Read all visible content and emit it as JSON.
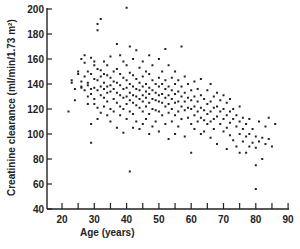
{
  "chart_data": {
    "type": "scatter",
    "title": "",
    "xlabel": "Age  (years)",
    "ylabel": "Creatinine clearance  (ml/min/1.73 m²)",
    "xlim": [
      15,
      90
    ],
    "ylim": [
      40,
      200
    ],
    "x_ticks": [
      20,
      30,
      40,
      50,
      60,
      70,
      80,
      90
    ],
    "x_minor_ticks": [
      25,
      35,
      45,
      55,
      65,
      75,
      85
    ],
    "y_ticks": [
      40,
      60,
      80,
      100,
      120,
      140,
      160,
      180,
      200
    ],
    "y_tick_labels": [
      "40",
      "60",
      "80",
      "100",
      "120",
      "140",
      "160",
      "180",
      "200"
    ],
    "grid": false,
    "legend": null,
    "trend": "negative correlation: clearance declines from ~140 at age 25 to ~95 at age 80",
    "series": [
      {
        "name": "subjects",
        "points": [
          [
            22,
            118
          ],
          [
            23,
            143
          ],
          [
            23,
            141
          ],
          [
            24,
            136
          ],
          [
            24,
            127
          ],
          [
            25,
            148
          ],
          [
            25,
            150
          ],
          [
            26,
            138
          ],
          [
            26,
            137
          ],
          [
            26,
            142
          ],
          [
            26,
            160
          ],
          [
            27,
            163
          ],
          [
            27,
            157
          ],
          [
            27,
            135
          ],
          [
            27,
            146
          ],
          [
            28,
            150
          ],
          [
            28,
            141
          ],
          [
            28,
            139
          ],
          [
            28,
            130
          ],
          [
            28,
            124
          ],
          [
            29,
            161
          ],
          [
            29,
            148
          ],
          [
            29,
            136
          ],
          [
            29,
            132
          ],
          [
            29,
            108
          ],
          [
            29,
            93
          ],
          [
            30,
            158
          ],
          [
            30,
            155
          ],
          [
            30,
            144
          ],
          [
            30,
            137
          ],
          [
            30,
            128
          ],
          [
            30,
            124
          ],
          [
            31,
            188
          ],
          [
            31,
            183
          ],
          [
            31,
            152
          ],
          [
            31,
            143
          ],
          [
            31,
            135
          ],
          [
            31,
            121
          ],
          [
            31,
            112
          ],
          [
            32,
            192
          ],
          [
            32,
            151
          ],
          [
            32,
            146
          ],
          [
            32,
            138
          ],
          [
            32,
            131
          ],
          [
            32,
            117
          ],
          [
            33,
            158
          ],
          [
            33,
            148
          ],
          [
            33,
            141
          ],
          [
            33,
            136
          ],
          [
            33,
            129
          ],
          [
            33,
            122
          ],
          [
            34,
            155
          ],
          [
            34,
            147
          ],
          [
            34,
            138
          ],
          [
            34,
            133
          ],
          [
            34,
            126
          ],
          [
            34,
            115
          ],
          [
            35,
            162
          ],
          [
            35,
            145
          ],
          [
            35,
            139
          ],
          [
            35,
            134
          ],
          [
            35,
            120
          ],
          [
            35,
            110
          ],
          [
            36,
            150
          ],
          [
            36,
            142
          ],
          [
            36,
            136
          ],
          [
            36,
            128
          ],
          [
            36,
            118
          ],
          [
            37,
            172
          ],
          [
            37,
            152
          ],
          [
            37,
            141
          ],
          [
            37,
            133
          ],
          [
            37,
            125
          ],
          [
            37,
            105
          ],
          [
            38,
            163
          ],
          [
            38,
            148
          ],
          [
            38,
            139
          ],
          [
            38,
            131
          ],
          [
            38,
            122
          ],
          [
            38,
            115
          ],
          [
            39,
            158
          ],
          [
            39,
            145
          ],
          [
            39,
            136
          ],
          [
            39,
            129
          ],
          [
            39,
            120
          ],
          [
            39,
            101
          ],
          [
            40,
            201
          ],
          [
            40,
            155
          ],
          [
            40,
            143
          ],
          [
            40,
            137
          ],
          [
            40,
            130
          ],
          [
            40,
            124
          ],
          [
            40,
            112
          ],
          [
            41,
            170
          ],
          [
            41,
            149
          ],
          [
            41,
            140
          ],
          [
            41,
            133
          ],
          [
            41,
            127
          ],
          [
            41,
            118
          ],
          [
            41,
            70
          ],
          [
            42,
            160
          ],
          [
            42,
            147
          ],
          [
            42,
            138
          ],
          [
            42,
            131
          ],
          [
            42,
            125
          ],
          [
            42,
            116
          ],
          [
            42,
            105
          ],
          [
            43,
            167
          ],
          [
            43,
            144
          ],
          [
            43,
            136
          ],
          [
            43,
            130
          ],
          [
            43,
            123
          ],
          [
            43,
            110
          ],
          [
            44,
            153
          ],
          [
            44,
            141
          ],
          [
            44,
            135
          ],
          [
            44,
            128
          ],
          [
            44,
            121
          ],
          [
            44,
            104
          ],
          [
            45,
            158
          ],
          [
            45,
            146
          ],
          [
            45,
            138
          ],
          [
            45,
            131
          ],
          [
            45,
            126
          ],
          [
            45,
            118
          ],
          [
            45,
            108
          ],
          [
            46,
            150
          ],
          [
            46,
            140
          ],
          [
            46,
            134
          ],
          [
            46,
            129
          ],
          [
            46,
            122
          ],
          [
            46,
            112
          ],
          [
            47,
            163
          ],
          [
            47,
            148
          ],
          [
            47,
            137
          ],
          [
            47,
            132
          ],
          [
            47,
            125
          ],
          [
            47,
            116
          ],
          [
            47,
            100
          ],
          [
            48,
            155
          ],
          [
            48,
            143
          ],
          [
            48,
            135
          ],
          [
            48,
            128
          ],
          [
            48,
            120
          ],
          [
            48,
            106
          ],
          [
            49,
            140
          ],
          [
            49,
            133
          ],
          [
            49,
            127
          ],
          [
            49,
            119
          ],
          [
            49,
            110
          ],
          [
            50,
            160
          ],
          [
            50,
            145
          ],
          [
            50,
            138
          ],
          [
            50,
            131
          ],
          [
            50,
            126
          ],
          [
            50,
            118
          ],
          [
            50,
            102
          ],
          [
            51,
            150
          ],
          [
            51,
            140
          ],
          [
            51,
            132
          ],
          [
            51,
            125
          ],
          [
            51,
            115
          ],
          [
            52,
            168
          ],
          [
            52,
            143
          ],
          [
            52,
            136
          ],
          [
            52,
            129
          ],
          [
            52,
            122
          ],
          [
            52,
            108
          ],
          [
            53,
            155
          ],
          [
            53,
            138
          ],
          [
            53,
            131
          ],
          [
            53,
            124
          ],
          [
            53,
            117
          ],
          [
            53,
            96
          ],
          [
            54,
            145
          ],
          [
            54,
            135
          ],
          [
            54,
            128
          ],
          [
            54,
            120
          ],
          [
            54,
            110
          ],
          [
            55,
            150
          ],
          [
            55,
            140
          ],
          [
            55,
            132
          ],
          [
            55,
            125
          ],
          [
            55,
            115
          ],
          [
            55,
            100
          ],
          [
            56,
            143
          ],
          [
            56,
            134
          ],
          [
            56,
            126
          ],
          [
            56,
            118
          ],
          [
            56,
            106
          ],
          [
            57,
            170
          ],
          [
            57,
            138
          ],
          [
            57,
            130
          ],
          [
            57,
            122
          ],
          [
            57,
            112
          ],
          [
            58,
            146
          ],
          [
            58,
            133
          ],
          [
            58,
            126
          ],
          [
            58,
            119
          ],
          [
            58,
            98
          ],
          [
            59,
            140
          ],
          [
            59,
            129
          ],
          [
            59,
            121
          ],
          [
            59,
            113
          ],
          [
            60,
            135
          ],
          [
            60,
            127
          ],
          [
            60,
            120
          ],
          [
            60,
            108
          ],
          [
            60,
            85
          ],
          [
            61,
            142
          ],
          [
            61,
            130
          ],
          [
            61,
            122
          ],
          [
            61,
            115
          ],
          [
            61,
            104
          ],
          [
            62,
            136
          ],
          [
            62,
            126
          ],
          [
            62,
            118
          ],
          [
            62,
            110
          ],
          [
            63,
            144
          ],
          [
            63,
            131
          ],
          [
            63,
            121
          ],
          [
            63,
            113
          ],
          [
            63,
            100
          ],
          [
            64,
            128
          ],
          [
            64,
            119
          ],
          [
            64,
            111
          ],
          [
            64,
            102
          ],
          [
            65,
            135
          ],
          [
            65,
            124
          ],
          [
            65,
            116
          ],
          [
            65,
            108
          ],
          [
            66,
            140
          ],
          [
            66,
            126
          ],
          [
            66,
            118
          ],
          [
            66,
            110
          ],
          [
            66,
            97
          ],
          [
            67,
            130
          ],
          [
            67,
            121
          ],
          [
            67,
            112
          ],
          [
            67,
            104
          ],
          [
            68,
            133
          ],
          [
            68,
            122
          ],
          [
            68,
            114
          ],
          [
            68,
            92
          ],
          [
            69,
            127
          ],
          [
            69,
            118
          ],
          [
            69,
            108
          ],
          [
            70,
            131
          ],
          [
            70,
            120
          ],
          [
            70,
            112
          ],
          [
            70,
            102
          ],
          [
            71,
            125
          ],
          [
            71,
            115
          ],
          [
            71,
            105
          ],
          [
            71,
            88
          ],
          [
            72,
            128
          ],
          [
            72,
            118
          ],
          [
            72,
            109
          ],
          [
            72,
            99
          ],
          [
            73,
            120
          ],
          [
            73,
            112
          ],
          [
            73,
            95
          ],
          [
            74,
            115
          ],
          [
            74,
            106
          ],
          [
            74,
            90
          ],
          [
            75,
            122
          ],
          [
            75,
            110
          ],
          [
            75,
            100
          ],
          [
            75,
            85
          ],
          [
            76,
            113
          ],
          [
            76,
            104
          ],
          [
            76,
            94
          ],
          [
            77,
            108
          ],
          [
            77,
            98
          ],
          [
            77,
            85
          ],
          [
            78,
            112
          ],
          [
            78,
            100
          ],
          [
            78,
            90
          ],
          [
            79,
            104
          ],
          [
            79,
            93
          ],
          [
            80,
            98
          ],
          [
            80,
            89
          ],
          [
            80,
            75
          ],
          [
            80,
            56
          ],
          [
            81,
            110
          ],
          [
            81,
            94
          ],
          [
            82,
            97
          ],
          [
            82,
            80
          ],
          [
            83,
            106
          ],
          [
            83,
            92
          ],
          [
            84,
            113
          ],
          [
            84,
            96
          ],
          [
            85,
            90
          ],
          [
            86,
            108
          ]
        ]
      }
    ]
  }
}
